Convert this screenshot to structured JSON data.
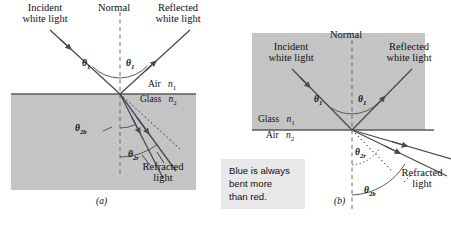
{
  "figure": {
    "background_color": "#ffffff",
    "glass_fill": "#c4c4c4",
    "ray_color": "#4a4a58",
    "normal_color": "#6a6a6a"
  },
  "panel_a": {
    "caption": "(a)",
    "normal_label": "Normal",
    "incident_label_line1": "Incident",
    "incident_label_line2": "white light",
    "reflected_label_line1": "Reflected",
    "reflected_label_line2": "white light",
    "refracted_label_line1": "Refracted",
    "refracted_label_line2": "light",
    "medium_upper_name": "Air",
    "medium_upper_index": "n",
    "medium_upper_sub": "1",
    "medium_lower_name": "Glass",
    "medium_lower_index": "n",
    "medium_lower_sub": "2",
    "angle_incident": "θ",
    "angle_incident_sub": "1",
    "angle_reflected": "θ",
    "angle_reflected_sub": "1",
    "angle_blue": "θ",
    "angle_blue_sub": "2b",
    "angle_red": "θ",
    "angle_red_sub": "2r"
  },
  "panel_b": {
    "caption": "(b)",
    "normal_label": "Normal",
    "incident_label_line1": "Incident",
    "incident_label_line2": "white light",
    "reflected_label_line1": "Reflected",
    "reflected_label_line2": "white light",
    "refracted_label_line1": "Refracted",
    "refracted_label_line2": "light",
    "medium_upper_name": "Glass",
    "medium_upper_index": "n",
    "medium_upper_sub": "1",
    "medium_lower_name": "Air",
    "medium_lower_index": "n",
    "medium_lower_sub": "2",
    "angle_incident": "θ",
    "angle_incident_sub": "1",
    "angle_reflected": "θ",
    "angle_reflected_sub": "1",
    "angle_red": "θ",
    "angle_red_sub": "2r",
    "angle_blue": "θ",
    "angle_blue_sub": "2b"
  },
  "callout": {
    "line1": "Blue is always",
    "line2": "bent more",
    "line3": "than red.",
    "background": "#e8e8e8"
  }
}
